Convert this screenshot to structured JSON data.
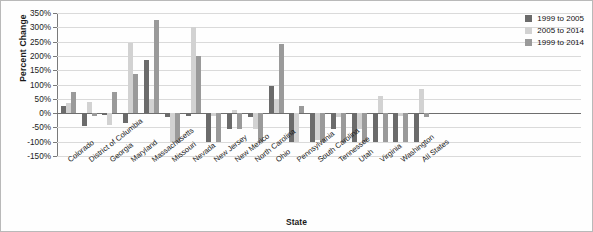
{
  "chart_data": {
    "type": "bar",
    "title": "",
    "xlabel": "State",
    "ylabel": "Percent Change",
    "ylim": [
      -150,
      350
    ],
    "ytick_step": 50,
    "ytick_labels": [
      "350%",
      "300%",
      "250%",
      "200%",
      "150%",
      "100%",
      "50%",
      "0%",
      "-50%",
      "-100%",
      "-150%"
    ],
    "ytick_values": [
      350,
      300,
      250,
      200,
      150,
      100,
      50,
      0,
      -50,
      -100,
      -150
    ],
    "grid": true,
    "legend_position": "top-right",
    "categories": [
      "Colorado",
      "District of Columbia",
      "Georgia",
      "Maryland",
      "Massachusetts",
      "Missouri",
      "Nevada",
      "New Jersey",
      "New Mexico",
      "North Carolina",
      "Ohio",
      "Pennsylvania",
      "South Carolina",
      "Tennessee",
      "Utah",
      "Virginia",
      "Washington",
      "All States"
    ],
    "series": [
      {
        "name": "1999 to 2005",
        "color": "#6b6b6b",
        "values": [
          25,
          -45,
          -8,
          -35,
          185,
          -15,
          -10,
          -100,
          -55,
          -12,
          95,
          -100,
          -100,
          -55,
          -100,
          -100,
          -100,
          -100
        ]
      },
      {
        "name": "2005 to 2014",
        "color": "#d2d2d2",
        "values": [
          35,
          40,
          -40,
          245,
          50,
          -100,
          300,
          -10,
          10,
          -55,
          50,
          -100,
          -95,
          -12,
          -55,
          60,
          -10,
          85
        ]
      },
      {
        "name": "1999 to 2014",
        "color": "#9a9a9a",
        "values": [
          75,
          -10,
          75,
          135,
          325,
          -100,
          200,
          -100,
          -55,
          -100,
          240,
          25,
          -100,
          -100,
          -100,
          -100,
          -100,
          -15
        ]
      }
    ]
  },
  "legend": {
    "items": [
      {
        "label": "1999 to 2005"
      },
      {
        "label": "2005 to 2014"
      },
      {
        "label": "1999 to 2014"
      }
    ]
  }
}
